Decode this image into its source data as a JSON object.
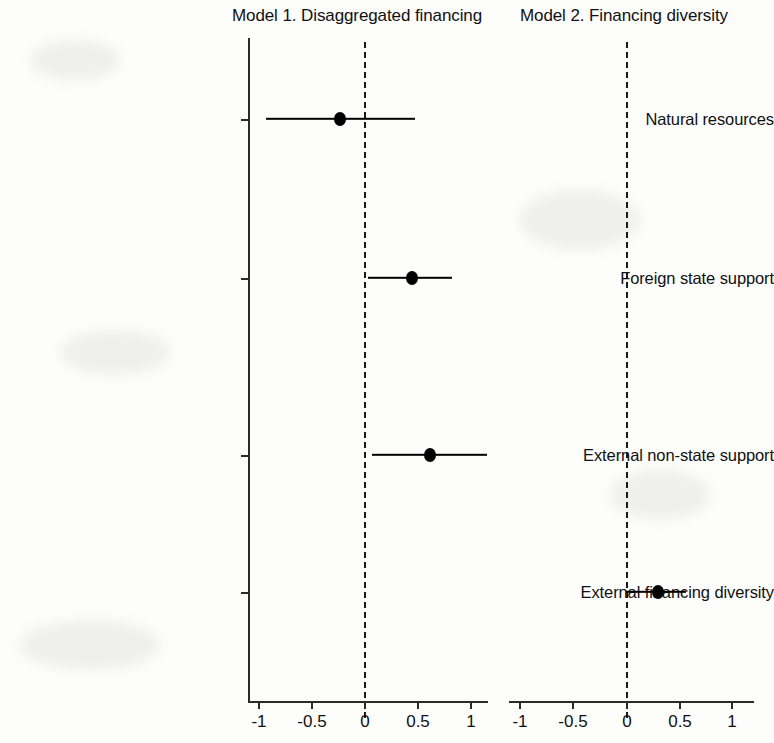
{
  "chart_data": {
    "type": "scatter",
    "title": "",
    "subtitle": "",
    "layout": "two-panel coefficient (forest) plot, horizontal point estimates with 95% confidence interval whiskers and a dashed vertical reference line at zero",
    "xlabel": "",
    "ylabel": "",
    "xlim": [
      -1.3,
      1.35
    ],
    "xticks": [
      -1,
      -0.5,
      0,
      0.5,
      1
    ],
    "xticklabels": [
      "-1",
      "-0.5",
      "0",
      "0.5",
      "1"
    ],
    "grid": false,
    "legend": null,
    "reference_line": 0,
    "categories": [
      "Natural resources",
      "Foreign state support",
      "External non-state support",
      "External financing diversity"
    ],
    "panels": [
      {
        "name": "Model 1. Disaggregated financing",
        "xticks": [
          -1,
          -0.5,
          0,
          0.5,
          1
        ],
        "xticklabels": [
          "-1",
          "-0.5",
          "0",
          "0.5",
          "1"
        ],
        "points": [
          {
            "category": "Natural resources",
            "estimate": -0.23,
            "ci_low": -0.92,
            "ci_high": 0.48
          },
          {
            "category": "Foreign state support",
            "estimate": 0.45,
            "ci_low": 0.04,
            "ci_high": 0.83
          },
          {
            "category": "External non-state support",
            "estimate": 0.62,
            "ci_low": 0.08,
            "ci_high": 1.16
          }
        ]
      },
      {
        "name": "Model 2. Financing diversity",
        "xticks": [
          -1,
          -0.5,
          0,
          0.5,
          1
        ],
        "xticklabels": [
          "-1",
          "-0.5",
          "0",
          "0.5",
          "1"
        ],
        "points": [
          {
            "category": "External financing diversity",
            "estimate": 0.3,
            "ci_low": 0.0,
            "ci_high": 0.57
          }
        ]
      }
    ]
  },
  "panels": {
    "model1_title": "Model 1. Disaggregated financing",
    "model2_title": "Model 2. Financing diversity"
  },
  "axis": {
    "categories": [
      "Natural resources",
      "Foreign state support",
      "External non-state support",
      "External financing diversity"
    ],
    "xticklabels": [
      "-1",
      "-0.5",
      "0",
      "0.5",
      "1"
    ]
  },
  "colors": {
    "point": "#000000",
    "interval": "#000000",
    "axis": "#2b2b2b",
    "reference": "#1a1a1a",
    "text": "#111111",
    "background": "#fdfdfc"
  }
}
